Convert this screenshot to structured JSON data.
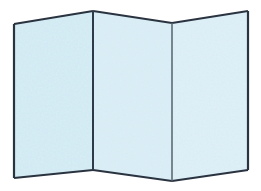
{
  "canvas": {
    "width": 261,
    "height": 191,
    "background_color": "#ffffff",
    "title": "Zigzag folded panel illustration"
  },
  "style": {
    "panel_fill": "#cbe7f2",
    "panel_fill_alt": "#d2eaf4",
    "panel_fill_light": "#d8eef6",
    "stroke_color": "#2a3340",
    "stroke_color_soft": "#55636f",
    "fold_line_color": "#2d3a4a",
    "outer_stroke_width": 2.2,
    "fold_stroke_width": 2.0,
    "inner_fold_stroke_width": 1.6,
    "texture_color": "#ffffff",
    "texture_opacity": 0.35
  },
  "vertices": {
    "top": [
      {
        "name": "top-left-corner",
        "x": 14,
        "y": 24
      },
      {
        "name": "top-fold-peak-1",
        "x": 93,
        "y": 11
      },
      {
        "name": "top-fold-valley-1",
        "x": 172,
        "y": 23
      },
      {
        "name": "top-right-corner",
        "x": 248,
        "y": 11
      }
    ],
    "bottom": [
      {
        "name": "bottom-left-corner",
        "x": 14,
        "y": 178
      },
      {
        "name": "bottom-fold-valley-1",
        "x": 93,
        "y": 170
      },
      {
        "name": "bottom-fold-peak-1",
        "x": 172,
        "y": 181
      },
      {
        "name": "bottom-right-corner",
        "x": 248,
        "y": 170
      }
    ]
  },
  "panels": [
    {
      "id": "panel-left",
      "label": "Left panel",
      "points": "14,24 93,11 93,170 14,178",
      "fill": "#cbe7f2"
    },
    {
      "id": "panel-middle",
      "label": "Middle panel",
      "points": "93,11 172,23 172,181 93,170",
      "fill": "#d2eaf4"
    },
    {
      "id": "panel-right",
      "label": "Right panel",
      "points": "172,23 248,11 248,170 172,181",
      "fill": "#d6ecf5"
    }
  ],
  "fold_lines": [
    {
      "id": "fold-line-1",
      "label": "First fold (mountain)",
      "x1": 93,
      "y1": 11,
      "x2": 93,
      "y2": 170,
      "color": "#2d3a4a",
      "width": 2.0
    },
    {
      "id": "fold-line-2",
      "label": "Second fold (valley)",
      "x1": 172,
      "y1": 23,
      "x2": 172,
      "y2": 181,
      "color": "#55636f",
      "width": 1.5
    }
  ],
  "outline_segments": [
    {
      "id": "edge-top-left",
      "label": "Top edge of left panel",
      "x1": 14,
      "y1": 24,
      "x2": 93,
      "y2": 11
    },
    {
      "id": "edge-top-middle",
      "label": "Top edge of middle panel",
      "x1": 93,
      "y1": 11,
      "x2": 172,
      "y2": 23
    },
    {
      "id": "edge-top-right",
      "label": "Top edge of right panel",
      "x1": 172,
      "y1": 23,
      "x2": 248,
      "y2": 11
    },
    {
      "id": "edge-right-side",
      "label": "Right outer edge",
      "x1": 248,
      "y1": 11,
      "x2": 248,
      "y2": 170
    },
    {
      "id": "edge-bottom-right",
      "label": "Bottom edge of right panel",
      "x1": 248,
      "y1": 170,
      "x2": 172,
      "y2": 181
    },
    {
      "id": "edge-bottom-middle",
      "label": "Bottom edge of middle panel",
      "x1": 172,
      "y1": 181,
      "x2": 93,
      "y2": 170
    },
    {
      "id": "edge-bottom-left",
      "label": "Bottom edge of left panel",
      "x1": 93,
      "y1": 170,
      "x2": 14,
      "y2": 178
    },
    {
      "id": "edge-left-side",
      "label": "Left outer edge",
      "x1": 14,
      "y1": 178,
      "x2": 14,
      "y2": 24
    }
  ],
  "figure": {
    "object_name": "Folded panel / accordion-folded sheet",
    "panel_count": "3",
    "fold_count": "2",
    "caption": ""
  }
}
